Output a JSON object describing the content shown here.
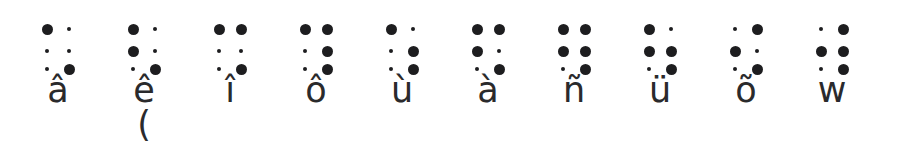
{
  "page": {
    "background_color": "#ffffff",
    "dot_color": "#1d1d1f",
    "text_color": "#2a2a2c"
  },
  "chart_data": {
    "type": "table",
    "title": "",
    "xlabel": "",
    "ylabel": "",
    "notation": "6-dot braille cell; dots numbered 1-2-3 down the left column and 4-5-6 down the right column",
    "columns": [
      "cell",
      "letter",
      "filled_dots",
      "note"
    ],
    "cells": [
      {
        "index": 1,
        "letter": "â",
        "dots": [
          1,
          6
        ],
        "note": ""
      },
      {
        "index": 2,
        "letter": "ê",
        "dots": [
          1,
          2,
          6
        ],
        "note": "("
      },
      {
        "index": 3,
        "letter": "î",
        "dots": [
          1,
          4,
          6
        ],
        "note": ""
      },
      {
        "index": 4,
        "letter": "ô",
        "dots": [
          1,
          4,
          5,
          6
        ],
        "note": ""
      },
      {
        "index": 5,
        "letter": "ù",
        "dots": [
          1,
          5,
          6
        ],
        "note": ""
      },
      {
        "index": 6,
        "letter": "à",
        "dots": [
          1,
          2,
          4,
          6
        ],
        "note": ""
      },
      {
        "index": 7,
        "letter": "ñ",
        "dots": [
          1,
          2,
          4,
          5,
          6
        ],
        "note": ""
      },
      {
        "index": 8,
        "letter": "ü",
        "dots": [
          1,
          2,
          5,
          6
        ],
        "note": ""
      },
      {
        "index": 9,
        "letter": "õ",
        "dots": [
          2,
          4,
          6
        ],
        "note": ""
      },
      {
        "index": 10,
        "letter": "w",
        "dots": [
          2,
          4,
          5,
          6
        ],
        "note": ""
      }
    ]
  }
}
